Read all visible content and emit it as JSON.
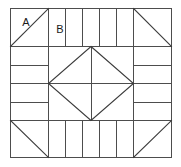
{
  "figure": {
    "name": "quilt-block-diagram",
    "background_color": "#ffffff",
    "line_color": "#4d4d4d",
    "diagonal_color": "#3c3c3c",
    "label_color": "#1a1a1a",
    "stroke_width": 1
  },
  "frame": {
    "x": 10,
    "y": 8,
    "width": 162,
    "height": 150,
    "corner_size": 38,
    "center_size": 76
  },
  "labels": [
    {
      "id": "A",
      "text": "A",
      "x": 26,
      "y": 22
    },
    {
      "id": "B",
      "text": "B",
      "x": 60,
      "y": 29
    }
  ],
  "regions": {
    "corners": [
      {
        "name": "corner-top-left",
        "diagonal": "tl-br",
        "label": "A"
      },
      {
        "name": "corner-top-right",
        "diagonal": "tl-br",
        "label": ""
      },
      {
        "name": "corner-bottom-left",
        "diagonal": "tl-br",
        "label": ""
      },
      {
        "name": "corner-bottom-right",
        "diagonal": "bl-tr",
        "label": ""
      }
    ],
    "bands": [
      {
        "name": "band-top",
        "orientation": "vertical",
        "strips": 5,
        "label": "B"
      },
      {
        "name": "band-bottom",
        "orientation": "vertical",
        "strips": 5,
        "label": ""
      },
      {
        "name": "band-left",
        "orientation": "horizontal",
        "strips": 4,
        "label": ""
      },
      {
        "name": "band-right",
        "orientation": "horizontal",
        "strips": 4,
        "label": ""
      }
    ],
    "center": {
      "name": "center-square",
      "shape": "inscribed-diamond",
      "midlines": [
        "vertical",
        "horizontal"
      ]
    }
  }
}
